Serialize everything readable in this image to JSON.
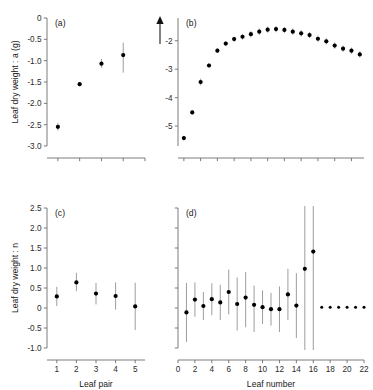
{
  "figure": {
    "panels": [
      "a",
      "b",
      "c",
      "d"
    ],
    "top_row_ylabel": "Leaf dry weight : a (g)",
    "bottom_row_ylabel": "Leaf dry weight : n",
    "bottom_left_xlabel": "Leaf pair",
    "bottom_right_xlabel": "Leaf number",
    "arrow_icon": "up-arrow-icon"
  },
  "chart_data": [
    {
      "type": "scatter",
      "panel": "a",
      "title": "(a)",
      "xlabel": "",
      "ylabel": "Leaf dry weight : a (g)",
      "ylim": [
        -3.0,
        0.0
      ],
      "yticks": [
        0,
        -0.5,
        -1.0,
        -1.5,
        -2.0,
        -2.5,
        -3.0
      ],
      "ytick_labels": [
        "0",
        "-0.5",
        "-1.0",
        "-1.5",
        "-2.0",
        "-2.5",
        "-3.0"
      ],
      "xlim": [
        0.5,
        5.0
      ],
      "xticks": [
        1,
        2,
        3,
        4,
        5
      ],
      "xtick_labels": [
        "",
        "",
        "",
        "",
        ""
      ],
      "grid": false,
      "legend": "none",
      "x": [
        1,
        2,
        3,
        4
      ],
      "values": [
        -2.55,
        -1.55,
        -1.07,
        -0.87
      ],
      "err_low": [
        -2.64,
        -1.6,
        -1.17,
        -1.28
      ],
      "err_high": [
        -2.46,
        -1.5,
        -0.96,
        -0.58
      ]
    },
    {
      "type": "scatter",
      "panel": "b",
      "title": "(b)",
      "xlabel": "",
      "ylabel": "",
      "ylim": [
        -5.7,
        -1.2
      ],
      "yticks": [
        -2,
        -3,
        -4,
        -5
      ],
      "ytick_labels": [
        "-2",
        "-3",
        "-4",
        "-5"
      ],
      "xlim": [
        0.3,
        22.5
      ],
      "xticks": [
        1,
        3,
        5,
        7,
        9,
        11,
        13,
        15,
        17,
        19,
        21
      ],
      "xtick_labels": [
        "",
        "",
        "",
        "",
        "",
        "",
        "",
        "",
        "",
        "",
        ""
      ],
      "grid": false,
      "legend": "none",
      "x": [
        1,
        2,
        3,
        4,
        5,
        6,
        7,
        8,
        9,
        10,
        11,
        12,
        13,
        14,
        15,
        16,
        17,
        18,
        19,
        20,
        21,
        22
      ],
      "values": [
        -5.42,
        -4.52,
        -3.45,
        -2.87,
        -2.35,
        -2.1,
        -1.94,
        -1.86,
        -1.77,
        -1.68,
        -1.61,
        -1.59,
        -1.62,
        -1.68,
        -1.74,
        -1.8,
        -1.93,
        -2.02,
        -2.17,
        -2.28,
        -2.35,
        -2.48,
        -2.75
      ],
      "err_low": [
        -5.5,
        -4.6,
        -3.57,
        -2.95,
        -2.43,
        -2.18,
        -2.03,
        -1.96,
        -1.88,
        -1.79,
        -1.72,
        -1.7,
        -1.73,
        -1.79,
        -1.85,
        -1.91,
        -2.04,
        -2.13,
        -2.28,
        -2.39,
        -2.46,
        -2.59,
        -2.86
      ],
      "err_high": [
        -5.34,
        -4.44,
        -3.33,
        -2.79,
        -2.27,
        -2.02,
        -1.85,
        -1.76,
        -1.66,
        -1.57,
        -1.5,
        -1.48,
        -1.51,
        -1.57,
        -1.63,
        -1.69,
        -1.82,
        -1.91,
        -2.06,
        -2.17,
        -2.24,
        -2.37,
        -2.64
      ]
    },
    {
      "type": "scatter",
      "panel": "c",
      "title": "(c)",
      "xlabel": "Leaf pair",
      "ylabel": "Leaf dry weight : n",
      "ylim": [
        -1.0,
        2.5
      ],
      "yticks": [
        2.5,
        2.0,
        1.5,
        1.0,
        0.5,
        0,
        -0.5,
        -1.0
      ],
      "ytick_labels": [
        "2.5",
        "2.0",
        "1.5",
        "1.0",
        "0.5",
        "0",
        "-0.5",
        "-1.0"
      ],
      "xlim": [
        0.5,
        5.5
      ],
      "xticks": [
        1,
        2,
        3,
        4,
        5
      ],
      "xtick_labels": [
        "1",
        "2",
        "3",
        "4",
        "5"
      ],
      "grid": false,
      "legend": "none",
      "x": [
        1,
        2,
        3,
        4,
        5
      ],
      "values": [
        0.29,
        0.64,
        0.36,
        0.3,
        0.04
      ],
      "err_low": [
        0.05,
        0.42,
        0.09,
        -0.04,
        -0.55
      ],
      "err_high": [
        0.53,
        0.88,
        0.63,
        0.64,
        0.63
      ]
    },
    {
      "type": "scatter",
      "panel": "d",
      "title": "(d)",
      "xlabel": "Leaf number",
      "ylabel": "",
      "ylim": [
        -1.0,
        2.5
      ],
      "yticks": [
        2.5,
        2.0,
        1.5,
        1.0,
        0.5,
        0,
        -0.5,
        -1.0
      ],
      "ytick_labels": [
        "",
        "",
        "",
        "",
        "",
        "",
        "",
        ""
      ],
      "xlim": [
        0,
        22
      ],
      "xticks": [
        0,
        2,
        4,
        6,
        8,
        10,
        12,
        14,
        16,
        18,
        20,
        22
      ],
      "xtick_labels": [
        "0",
        "2",
        "4",
        "6",
        "8",
        "10",
        "12",
        "14",
        "16",
        "18",
        "20",
        "22"
      ],
      "grid": false,
      "legend": "none",
      "x": [
        1,
        2,
        3,
        4,
        5,
        6,
        7,
        8,
        9,
        10,
        11,
        12,
        13,
        14,
        15,
        16,
        17,
        18,
        19,
        20,
        21,
        22
      ],
      "values": [
        -0.11,
        0.21,
        0.05,
        0.22,
        0.14,
        0.4,
        0.1,
        0.26,
        0.08,
        0.02,
        -0.03,
        -0.03,
        0.34,
        0.06,
        0.98,
        1.41,
        0.02,
        0.02,
        0.02,
        0.02,
        0.02,
        0.02
      ],
      "err_low": [
        -0.85,
        -0.22,
        -0.3,
        -0.18,
        -0.3,
        -0.16,
        -0.56,
        -0.48,
        -0.6,
        -0.4,
        -0.44,
        -0.6,
        -0.3,
        -0.75,
        -1.6,
        -1.65,
        0.02,
        0.02,
        0.02,
        0.02,
        0.02,
        0.02
      ],
      "err_high": [
        0.63,
        0.64,
        0.4,
        0.62,
        0.58,
        0.96,
        0.76,
        0.9,
        0.56,
        0.44,
        0.38,
        0.54,
        0.98,
        0.87,
        2.58,
        2.6,
        0.02,
        0.02,
        0.02,
        0.02,
        0.02,
        0.02
      ],
      "no_error_from": 17
    }
  ]
}
